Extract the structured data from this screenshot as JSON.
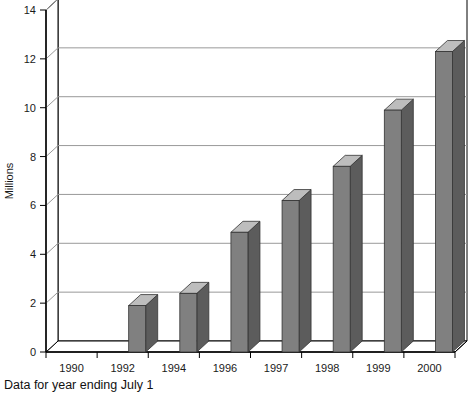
{
  "chart_data": {
    "type": "bar",
    "title": "",
    "subtitle": "",
    "xlabel": "",
    "ylabel": "Millions",
    "categories": [
      "1990",
      "1992",
      "1994",
      "1996",
      "1997",
      "1998",
      "1999",
      "2000"
    ],
    "values": [
      0,
      1.9,
      2.4,
      4.9,
      6.2,
      7.6,
      9.9,
      12.3
    ],
    "series": [
      {
        "name": "Millions",
        "values": [
          0,
          1.9,
          2.4,
          4.9,
          6.2,
          7.6,
          9.9,
          12.3
        ]
      }
    ],
    "ylim": [
      0,
      14
    ],
    "yticks": [
      0,
      2,
      4,
      6,
      8,
      10,
      12,
      14
    ],
    "ytick_labels": [
      "0",
      "2",
      "4",
      "6",
      "8",
      "10",
      "12",
      "14"
    ],
    "grid": true,
    "grid_axis": "y",
    "legend": false,
    "legend_position": "none",
    "style_3d": true,
    "annotations": [
      "Data for year ending July 1"
    ]
  },
  "caption": {
    "text": "Data for year ending July 1"
  },
  "colors": {
    "bar_front": "#808080",
    "bar_top": "#bdbdbd",
    "bar_side": "#5c5c5c",
    "axis": "#000000",
    "grid": "#999999",
    "background": "#ffffff",
    "text": "#111111"
  }
}
